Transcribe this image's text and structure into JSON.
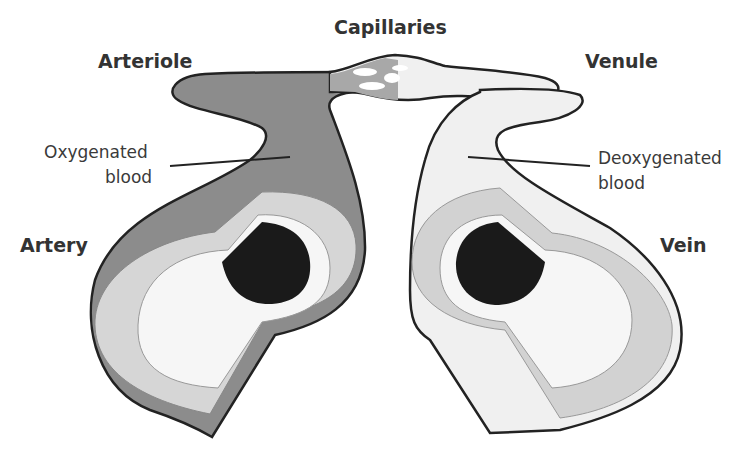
{
  "diagram": {
    "labels": {
      "capillaries": "Capillaries",
      "arteriole": "Arteriole",
      "venule": "Venule",
      "artery": "Artery",
      "vein": "Vein",
      "oxygenated_line1": "Oxygenated",
      "oxygenated_line2": "blood",
      "deoxygenated_line1": "Deoxygenated",
      "deoxygenated_line2": "blood"
    },
    "colors": {
      "outline": "#222222",
      "artery_outer_wall": "#8c8c8c",
      "artery_middle_wall": "#d6d6d6",
      "vein_outer_wall": "#f0f0f0",
      "vein_middle_wall": "#d2d2d2",
      "lumen": "#f6f6f6",
      "blood_clot": "#1a1a1a"
    }
  }
}
